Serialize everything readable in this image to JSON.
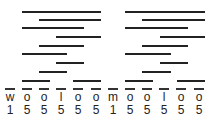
{
  "diagram": {
    "letters": [
      "w",
      "o",
      "o",
      "l",
      "o",
      "o",
      "m",
      "o",
      "o",
      "l",
      "o",
      "o"
    ],
    "numbers": [
      "1",
      "5",
      "5",
      "5",
      "5",
      "5",
      "1",
      "5",
      "5",
      "5",
      "5",
      "5"
    ],
    "column_x": [
      5,
      22,
      39,
      56,
      73,
      91,
      108,
      125,
      142,
      159,
      176,
      194
    ],
    "bars": [
      {
        "y": 11,
        "x1": 22,
        "x2": 101
      },
      {
        "y": 19,
        "x1": 39,
        "x2": 101
      },
      {
        "y": 27,
        "x1": 22,
        "x2": 84
      },
      {
        "y": 36,
        "x1": 56,
        "x2": 101
      },
      {
        "y": 45,
        "x1": 39,
        "x2": 84
      },
      {
        "y": 53,
        "x1": 22,
        "x2": 67
      },
      {
        "y": 62,
        "x1": 56,
        "x2": 84
      },
      {
        "y": 71,
        "x1": 39,
        "x2": 67
      },
      {
        "y": 80,
        "x1": 22,
        "x2": 50
      },
      {
        "y": 80,
        "x1": 73,
        "x2": 101
      },
      {
        "y": 11,
        "x1": 125,
        "x2": 205
      },
      {
        "y": 19,
        "x1": 142,
        "x2": 205
      },
      {
        "y": 27,
        "x1": 125,
        "x2": 188
      },
      {
        "y": 36,
        "x1": 160,
        "x2": 205
      },
      {
        "y": 45,
        "x1": 142,
        "x2": 188
      },
      {
        "y": 53,
        "x1": 125,
        "x2": 171
      },
      {
        "y": 62,
        "x1": 160,
        "x2": 188
      },
      {
        "y": 71,
        "x1": 142,
        "x2": 171
      },
      {
        "y": 80,
        "x1": 125,
        "x2": 153
      },
      {
        "y": 80,
        "x1": 177,
        "x2": 205
      }
    ]
  }
}
